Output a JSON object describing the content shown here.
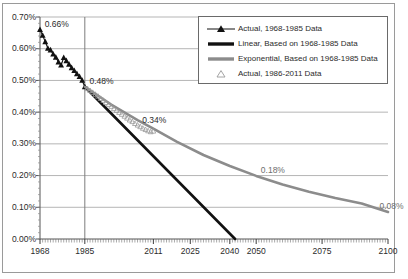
{
  "chart_data": {
    "type": "line",
    "title": "",
    "xlabel": "",
    "ylabel": "",
    "xlim": [
      1968,
      2100
    ],
    "ylim": [
      0.0,
      0.7
    ],
    "grid": true,
    "legend_position": "top-right",
    "y_ticks": [
      "0.00%",
      "0.10%",
      "0.20%",
      "0.30%",
      "0.40%",
      "0.50%",
      "0.60%",
      "0.70%"
    ],
    "y_tick_values": [
      0.0,
      0.1,
      0.2,
      0.3,
      0.4,
      0.5,
      0.6,
      0.7
    ],
    "x_ticks": [
      "1968",
      "1985",
      "2011",
      "2025",
      "2040",
      "2050",
      "2075",
      "2100"
    ],
    "x_tick_values": [
      1968,
      1985,
      2011,
      2025,
      2040,
      2050,
      2075,
      2100
    ],
    "annotations": [
      {
        "label": "0.66%",
        "x": 1969,
        "y": 0.66,
        "color": "#2b2b2b"
      },
      {
        "label": "0.48%",
        "x": 1986,
        "y": 0.48,
        "color": "#2b2b2b"
      },
      {
        "label": "0.34%",
        "x": 2006,
        "y": 0.355,
        "color": "#2b2b2b"
      },
      {
        "label": "0.18%",
        "x": 2051,
        "y": 0.2,
        "color": "#6e6e6e"
      },
      {
        "label": "0.08%",
        "x": 2096,
        "y": 0.085,
        "color": "#6e6e6e"
      }
    ],
    "series": [
      {
        "name": "Actual, 1968-1985 Data",
        "type": "scatter-line",
        "marker": "filled-triangle",
        "color": "#111111",
        "x": [
          1968,
          1969,
          1970,
          1971,
          1972,
          1973,
          1974,
          1975,
          1976,
          1977,
          1978,
          1979,
          1980,
          1981,
          1982,
          1983,
          1984,
          1985
        ],
        "values": [
          0.66,
          0.642,
          0.622,
          0.601,
          0.596,
          0.583,
          0.573,
          0.558,
          0.548,
          0.572,
          0.562,
          0.551,
          0.54,
          0.531,
          0.521,
          0.512,
          0.5,
          0.48
        ]
      },
      {
        "name": "Linear, Based on 1968-1985 Data",
        "type": "line",
        "color": "#111111",
        "x": [
          1985,
          2042
        ],
        "values": [
          0.48,
          0.0
        ]
      },
      {
        "name": "Exponential, Based on 1968-1985 Data",
        "type": "line",
        "color": "#8c8c8c",
        "x": [
          1985,
          1995,
          2005,
          2011,
          2020,
          2030,
          2040,
          2050,
          2060,
          2070,
          2080,
          2090,
          2100
        ],
        "values": [
          0.48,
          0.424,
          0.375,
          0.348,
          0.306,
          0.265,
          0.23,
          0.199,
          0.172,
          0.149,
          0.129,
          0.112,
          0.085
        ]
      },
      {
        "name": "Actual, 1986-2011 Data",
        "type": "scatter",
        "marker": "hollow-triangle",
        "color": "#9a9a9a",
        "x": [
          1986,
          1987,
          1988,
          1989,
          1990,
          1991,
          1992,
          1993,
          1994,
          1995,
          1996,
          1997,
          1998,
          1999,
          2000,
          2001,
          2002,
          2003,
          2004,
          2005,
          2006,
          2007,
          2008,
          2009,
          2010,
          2011
        ],
        "values": [
          0.474,
          0.468,
          0.462,
          0.456,
          0.45,
          0.443,
          0.437,
          0.43,
          0.424,
          0.418,
          0.411,
          0.405,
          0.399,
          0.393,
          0.387,
          0.381,
          0.375,
          0.37,
          0.364,
          0.359,
          0.354,
          0.349,
          0.345,
          0.341,
          0.338,
          0.34
        ]
      }
    ]
  },
  "legend": {
    "items": [
      {
        "label": "Actual, 1968-1985 Data",
        "key": "filled-triangle-line",
        "color": "#111111"
      },
      {
        "label": "Linear, Based on 1968-1985 Data",
        "key": "thick-black-line",
        "color": "#111111"
      },
      {
        "label": "Exponential, Based on 1968-1985 Data",
        "key": "thick-gray-line",
        "color": "#8c8c8c"
      },
      {
        "label": "Actual, 1986-2011 Data",
        "key": "hollow-triangle",
        "color": "#9a9a9a"
      }
    ]
  },
  "colors": {
    "actual_early": "#111111",
    "linear_trend": "#111111",
    "exponential_trend": "#8c8c8c",
    "actual_late": "#9a9a9a",
    "gridline": "#b5b5b5",
    "axis": "#555555",
    "frame": "#9a9a9a"
  }
}
